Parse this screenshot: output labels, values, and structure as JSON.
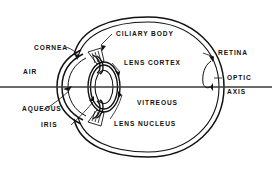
{
  "figure": {
    "type": "anatomical-diagram",
    "background_color": "#ffffff",
    "line_color": "#111111",
    "width": 272,
    "height": 173
  },
  "labels": {
    "cornea": "CORNEA",
    "air": "AIR",
    "aqueous": "AQUEOUS",
    "iris": "IRIS",
    "ciliary_body": "CILIARY BODY",
    "lens_cortex": "LENS CORTEX",
    "vitreous": "VITREOUS",
    "lens_nucleus": "LENS NUCLEUS",
    "retina": "RETINA",
    "optic": "OPTIC",
    "axis": "AXIS"
  },
  "structures": [
    {
      "name": "sclera-outer-wall",
      "label_key": "retina"
    },
    {
      "name": "retina-inner-wall",
      "label_key": "retina"
    },
    {
      "name": "cornea",
      "label_key": "cornea"
    },
    {
      "name": "anterior-chamber-aqueous",
      "label_key": "aqueous"
    },
    {
      "name": "iris",
      "label_key": "iris"
    },
    {
      "name": "ciliary-body",
      "label_key": "ciliary_body"
    },
    {
      "name": "lens-cortex",
      "label_key": "lens_cortex"
    },
    {
      "name": "lens-nucleus",
      "label_key": "lens_nucleus"
    },
    {
      "name": "vitreous-humour",
      "label_key": "vitreous"
    },
    {
      "name": "optic-axis-line",
      "label_key": "optic"
    }
  ]
}
